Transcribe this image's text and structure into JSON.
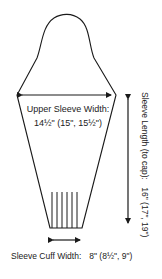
{
  "diagram": {
    "upper_sleeve_width": {
      "label": "Upper Sleeve Width:",
      "value": "14½\" (15\", 15½\")"
    },
    "sleeve_length": {
      "label": "Sleeve Length (to cap):",
      "value": "16\" (17\", 19\")",
      "full_text": "Sleeve Length (to cap):  16\" (17\", 19\")"
    },
    "sleeve_cuff_width": {
      "label": "Sleeve Cuff Width:",
      "value": "8\" (8½\", 9\")"
    },
    "colors": {
      "line": "#1a1a1a",
      "background": "#ffffff"
    }
  }
}
